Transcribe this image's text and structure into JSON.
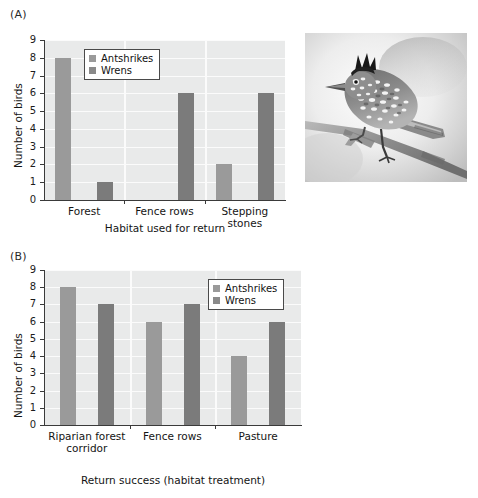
{
  "figure": {
    "panel_a_label": "(A)",
    "panel_b_label": "(B)"
  },
  "photo": {
    "name": "barred-antshrike-photograph",
    "subject": "Antshrike perched on branch",
    "style": "black-and-white photograph"
  },
  "legend": {
    "antshrikes": "Antshrikes",
    "wrens": "Wrens",
    "antshrike_color": "#9a9a9a",
    "wren_color": "#7b7b7b"
  },
  "chart_data": [
    {
      "type": "bar",
      "panel": "(A)",
      "title": "",
      "xlabel": "Habitat used for return",
      "ylabel": "Number of birds",
      "ylim": [
        0,
        9
      ],
      "yticks": [
        "0",
        "1",
        "2",
        "3",
        "4",
        "5",
        "6",
        "7",
        "8",
        "9"
      ],
      "grid": true,
      "legend_position": "top-left-inside",
      "categories": [
        "Forest",
        "Fence rows",
        "Stepping stones"
      ],
      "series": [
        {
          "name": "Antshrikes",
          "values": [
            8,
            0,
            2
          ],
          "color": "#9a9a9a"
        },
        {
          "name": "Wrens",
          "values": [
            1,
            6,
            6
          ],
          "color": "#7b7b7b"
        }
      ]
    },
    {
      "type": "bar",
      "panel": "(B)",
      "title": "",
      "xlabel": "Return success (habitat treatment)",
      "ylabel": "Number of birds",
      "ylim": [
        0,
        9
      ],
      "yticks": [
        "0",
        "1",
        "2",
        "3",
        "4",
        "5",
        "6",
        "7",
        "8",
        "9"
      ],
      "grid": true,
      "legend_position": "top-right-inside",
      "categories": [
        "Riparian forest corridor",
        "Fence rows",
        "Pasture"
      ],
      "category_lines": [
        [
          "Riparian forest",
          "corridor"
        ],
        [
          "Fence rows",
          ""
        ],
        [
          "Pasture",
          ""
        ]
      ],
      "series": [
        {
          "name": "Antshrikes",
          "values": [
            8,
            6,
            4
          ],
          "color": "#9a9a9a"
        },
        {
          "name": "Wrens",
          "values": [
            7,
            7,
            6
          ],
          "color": "#7b7b7b"
        }
      ]
    }
  ]
}
